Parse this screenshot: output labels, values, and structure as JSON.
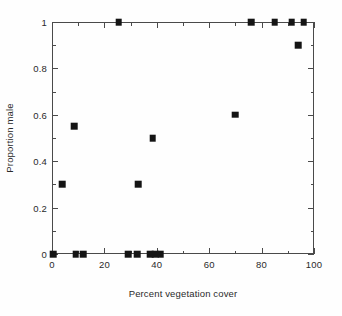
{
  "chart_data": {
    "type": "scatter",
    "title": "",
    "xlabel": "Percent vegetation cover",
    "ylabel": "Proportion male",
    "xlim": [
      0,
      100
    ],
    "ylim": [
      0,
      1
    ],
    "grid": false,
    "legend": null,
    "x_ticks": [
      0,
      20,
      40,
      60,
      80,
      100
    ],
    "x_tick_labels": [
      "0",
      "20",
      "40",
      "60",
      "80",
      "100"
    ],
    "x_minor_ticks": [
      10,
      30,
      50,
      70,
      90
    ],
    "y_ticks": [
      0,
      0.2,
      0.4,
      0.6,
      0.8,
      1
    ],
    "y_tick_labels": [
      "0",
      "0.2",
      "0.4",
      "0.6",
      "0.8",
      "1"
    ],
    "y_minor_ticks": [
      0.1,
      0.3,
      0.5,
      0.7,
      0.9
    ],
    "marker": "filled-square",
    "marker_color": "#141414",
    "points": [
      {
        "x": 0.5,
        "y": 0.0
      },
      {
        "x": 4.0,
        "y": 0.3
      },
      {
        "x": 8.5,
        "y": 0.55
      },
      {
        "x": 9.0,
        "y": 0.0
      },
      {
        "x": 12.0,
        "y": 0.0
      },
      {
        "x": 25.5,
        "y": 1.0
      },
      {
        "x": 29.0,
        "y": 0.0
      },
      {
        "x": 32.5,
        "y": 0.0
      },
      {
        "x": 33.0,
        "y": 0.3
      },
      {
        "x": 37.5,
        "y": 0.0
      },
      {
        "x": 38.5,
        "y": 0.5
      },
      {
        "x": 39.5,
        "y": 0.0
      },
      {
        "x": 41.5,
        "y": 0.0
      },
      {
        "x": 70.0,
        "y": 0.6
      },
      {
        "x": 76.0,
        "y": 1.0
      },
      {
        "x": 85.0,
        "y": 1.0
      },
      {
        "x": 91.5,
        "y": 1.0
      },
      {
        "x": 94.0,
        "y": 0.9
      },
      {
        "x": 96.0,
        "y": 1.0
      }
    ]
  }
}
